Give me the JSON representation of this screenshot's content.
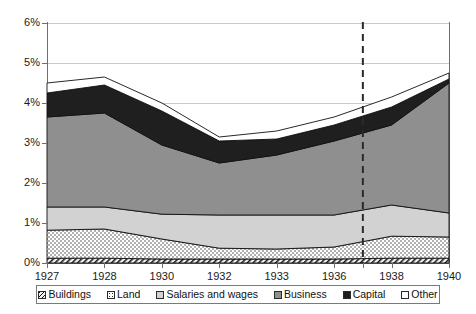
{
  "chart_data": {
    "type": "area",
    "title": "",
    "subtitle": "",
    "xlabel": "",
    "ylabel": "",
    "stacked": true,
    "grid": true,
    "legend_position": "bottom",
    "ylim": [
      0,
      6
    ],
    "ytick_labels": [
      "0%",
      "1%",
      "2%",
      "3%",
      "4%",
      "5%",
      "6%"
    ],
    "ytick_values": [
      0,
      1,
      2,
      3,
      4,
      5,
      6
    ],
    "categories": [
      "1927",
      "1928",
      "1930",
      "1932",
      "1933",
      "1936",
      "1938",
      "1940"
    ],
    "series": [
      {
        "name": "Buildings",
        "values": [
          0.12,
          0.12,
          0.1,
          0.1,
          0.1,
          0.1,
          0.12,
          0.12
        ]
      },
      {
        "name": "Land",
        "values": [
          0.7,
          0.73,
          0.5,
          0.27,
          0.25,
          0.3,
          0.55,
          0.53
        ]
      },
      {
        "name": "Salaries and wages",
        "values": [
          0.58,
          0.55,
          0.62,
          0.83,
          0.85,
          0.8,
          0.78,
          0.6
        ]
      },
      {
        "name": "Business",
        "values": [
          2.25,
          2.35,
          1.73,
          1.3,
          1.5,
          1.85,
          2.0,
          3.25
        ]
      },
      {
        "name": "Capital",
        "values": [
          0.6,
          0.7,
          0.85,
          0.55,
          0.4,
          0.4,
          0.45,
          0.1
        ]
      },
      {
        "name": "Other",
        "values": [
          0.25,
          0.2,
          0.2,
          0.1,
          0.2,
          0.2,
          0.25,
          0.15
        ]
      }
    ],
    "cumulative_tops": {
      "Buildings": [
        0.12,
        0.12,
        0.1,
        0.1,
        0.1,
        0.1,
        0.12,
        0.12
      ],
      "Land": [
        0.82,
        0.85,
        0.6,
        0.37,
        0.35,
        0.4,
        0.67,
        0.65
      ],
      "Salaries and wages": [
        1.4,
        1.4,
        1.22,
        1.2,
        1.2,
        1.2,
        1.45,
        1.25
      ],
      "Business": [
        3.65,
        3.75,
        2.95,
        2.5,
        2.7,
        3.05,
        3.45,
        4.5
      ],
      "Capital": [
        4.25,
        4.45,
        3.8,
        3.05,
        3.1,
        3.45,
        3.9,
        4.6
      ],
      "Other": [
        4.5,
        4.65,
        4.0,
        3.15,
        3.3,
        3.65,
        4.15,
        4.75
      ]
    },
    "annotations": [
      {
        "type": "vertical-dashed-line",
        "x_category_between": [
          "1936",
          "1938"
        ],
        "label": ""
      }
    ],
    "legend": [
      {
        "label": "Buildings",
        "swatch": "hatched-diagonal"
      },
      {
        "label": "Land",
        "swatch": "dotted-white"
      },
      {
        "label": "Salaries and wages",
        "swatch": "light-gray"
      },
      {
        "label": "Business",
        "swatch": "medium-gray"
      },
      {
        "label": "Capital",
        "swatch": "black"
      },
      {
        "label": "Other",
        "swatch": "white"
      }
    ],
    "colors": {
      "buildings": "#f2f2f2",
      "land": "#ffffff",
      "salaries": "#d2d2d2",
      "business": "#8f8f8f",
      "capital": "#1f1f1f",
      "other": "#ffffff",
      "gridline": "#c9c9c9",
      "axis": "#6e6e6e",
      "annotation_line": "#2b2b2b"
    }
  }
}
